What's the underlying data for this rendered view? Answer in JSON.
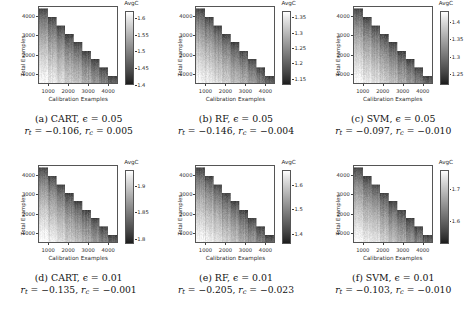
{
  "figure": {
    "colorbar_title": "AvgC",
    "xlabel": "Calibration Examples",
    "ylabel": "Total Examples",
    "xticks": [
      "1000",
      "2000",
      "3000",
      "4000"
    ],
    "yticks": [
      "4000",
      "3000",
      "2000",
      "1000"
    ]
  },
  "chart_data": [
    {
      "type": "heatmap",
      "panel": "a",
      "title": "CART, ϵ = 0.05",
      "model": "CART",
      "epsilon": 0.05,
      "r_t": -0.106,
      "r_c": 0.005,
      "xlabel": "Calibration Examples",
      "ylabel": "Total Examples",
      "xlim": [
        500,
        4500
      ],
      "ylim": [
        500,
        4500
      ],
      "xticks": [
        1000,
        2000,
        3000,
        4000
      ],
      "yticks": [
        1000,
        2000,
        3000,
        4000
      ],
      "colorbar_label": "AvgC",
      "colorbar_ticks": [
        1.6,
        1.55,
        1.5,
        1.45,
        1.4
      ],
      "zlim": [
        1.4,
        1.62
      ],
      "grid": false,
      "legend": "none",
      "note": "Grayscale heatmap; valid region is lower-triangular staircase where Calibration Examples <= Total Examples; AvgC decreases toward the diagonal boundary."
    },
    {
      "type": "heatmap",
      "panel": "b",
      "title": "RF, ϵ = 0.05",
      "model": "RF",
      "epsilon": 0.05,
      "r_t": -0.146,
      "r_c": -0.004,
      "xlabel": "Calibration Examples",
      "ylabel": "Total Examples",
      "xlim": [
        500,
        4500
      ],
      "ylim": [
        500,
        4500
      ],
      "xticks": [
        1000,
        2000,
        3000,
        4000
      ],
      "yticks": [
        1000,
        2000,
        3000,
        4000
      ],
      "colorbar_label": "AvgC",
      "colorbar_ticks": [
        1.35,
        1.3,
        1.25,
        1.2,
        1.15
      ],
      "zlim": [
        1.13,
        1.37
      ],
      "grid": false,
      "legend": "none"
    },
    {
      "type": "heatmap",
      "panel": "c",
      "title": "SVM, ϵ = 0.05",
      "model": "SVM",
      "epsilon": 0.05,
      "r_t": -0.097,
      "r_c": -0.01,
      "xlabel": "Calibration Examples",
      "ylabel": "Total Examples",
      "xlim": [
        500,
        4500
      ],
      "ylim": [
        500,
        4500
      ],
      "xticks": [
        1000,
        2000,
        3000,
        4000
      ],
      "yticks": [
        1000,
        2000,
        3000,
        4000
      ],
      "colorbar_label": "AvgC",
      "colorbar_ticks": [
        1.4,
        1.35,
        1.3,
        1.25
      ],
      "zlim": [
        1.22,
        1.43
      ],
      "grid": false,
      "legend": "none"
    },
    {
      "type": "heatmap",
      "panel": "d",
      "title": "CART, ϵ = 0.01",
      "model": "CART",
      "epsilon": 0.01,
      "r_t": -0.135,
      "r_c": -0.001,
      "xlabel": "Calibration Examples",
      "ylabel": "Total Examples",
      "xlim": [
        500,
        4500
      ],
      "ylim": [
        500,
        4500
      ],
      "xticks": [
        1000,
        2000,
        3000,
        4000
      ],
      "yticks": [
        1000,
        2000,
        3000,
        4000
      ],
      "colorbar_label": "AvgC",
      "colorbar_ticks": [
        1.9,
        1.85,
        1.8
      ],
      "zlim": [
        1.79,
        1.93
      ],
      "grid": false,
      "legend": "none"
    },
    {
      "type": "heatmap",
      "panel": "e",
      "title": "RF, ϵ = 0.01",
      "model": "RF",
      "epsilon": 0.01,
      "r_t": -0.205,
      "r_c": -0.023,
      "xlabel": "Calibration Examples",
      "ylabel": "Total Examples",
      "xlim": [
        500,
        4500
      ],
      "ylim": [
        500,
        4500
      ],
      "xticks": [
        1000,
        2000,
        3000,
        4000
      ],
      "yticks": [
        1000,
        2000,
        3000,
        4000
      ],
      "colorbar_label": "AvgC",
      "colorbar_ticks": [
        1.6,
        1.5,
        1.4
      ],
      "zlim": [
        1.36,
        1.66
      ],
      "grid": false,
      "legend": "none"
    },
    {
      "type": "heatmap",
      "panel": "f",
      "title": "SVM, ϵ = 0.01",
      "model": "SVM",
      "epsilon": 0.01,
      "r_t": -0.103,
      "r_c": -0.01,
      "xlabel": "Calibration Examples",
      "ylabel": "Total Examples",
      "xlim": [
        500,
        4500
      ],
      "ylim": [
        500,
        4500
      ],
      "xticks": [
        1000,
        2000,
        3000,
        4000
      ],
      "yticks": [
        1000,
        2000,
        3000,
        4000
      ],
      "colorbar_label": "AvgC",
      "colorbar_ticks": [
        1.7,
        1.6
      ],
      "zlim": [
        1.53,
        1.76
      ],
      "grid": false,
      "legend": "none"
    }
  ],
  "captions": [
    {
      "id": "a",
      "tag": "(a)",
      "line1": "(a) CART, ϵ = 0.05",
      "rt": "−0.106",
      "rc": "0.005"
    },
    {
      "id": "b",
      "tag": "(b)",
      "line1": "(b) RF, ϵ = 0.05",
      "rt": "−0.146",
      "rc": "−0.004"
    },
    {
      "id": "c",
      "tag": "(c)",
      "line1": "(c) SVM, ϵ = 0.05",
      "rt": "−0.097",
      "rc": "−0.010"
    },
    {
      "id": "d",
      "tag": "(d)",
      "line1": "(d) CART, ϵ = 0.01",
      "rt": "−0.135",
      "rc": "−0.001"
    },
    {
      "id": "e",
      "tag": "(e)",
      "line1": "(e) RF, ϵ = 0.01",
      "rt": "−0.205",
      "rc": "−0.023"
    },
    {
      "id": "f",
      "tag": "(f)",
      "line1": "(f) SVM, ϵ = 0.01",
      "rt": "−0.103",
      "rc": "−0.010"
    }
  ]
}
